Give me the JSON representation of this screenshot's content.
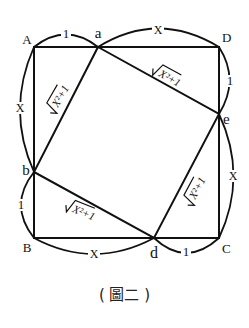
{
  "figure": {
    "caption": "( 圖二 )",
    "vertices": {
      "A": "A",
      "B": "B",
      "C": "C",
      "D": "D",
      "a": "a",
      "b": "b",
      "d": "d",
      "e": "e"
    },
    "arc_labels": {
      "Aa": "1",
      "aD": "X",
      "De": "1",
      "eC": "X",
      "Cd": "1",
      "dB": "X",
      "Bb": "1",
      "bA": "X"
    },
    "hypotenuse_label": "√X²+1",
    "inner_sides": {
      "ab": "√X²+1",
      "ae": "√X²+1",
      "bd": "√X²+1",
      "de": "√X²+1"
    }
  }
}
